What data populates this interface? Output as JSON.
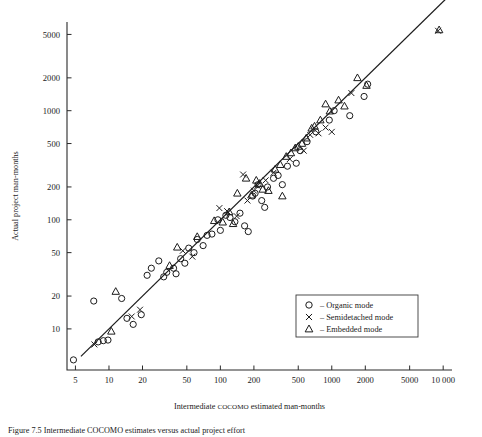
{
  "figure": {
    "caption": "Figure 7.5 Intermediate COCOMO estimates versus actual project effort"
  },
  "chart_data": {
    "type": "scatter",
    "title": "",
    "xlabel_prefix": "Intermediate ",
    "xlabel_smallcaps": "COCOMO",
    "xlabel_suffix": " estimated man-months",
    "xlabel": "Intermediate COCOMO estimated man-months",
    "ylabel": "Actual project man-months",
    "xscale": "log",
    "yscale": "log",
    "xlim": [
      4.2,
      12000
    ],
    "ylim": [
      4.2,
      6500
    ],
    "grid": false,
    "xticks": [
      5,
      10,
      20,
      50,
      100,
      200,
      500,
      1000,
      2000,
      5000,
      10000
    ],
    "xticklabels": [
      "5",
      "10",
      "20",
      "50",
      "100",
      "200",
      "500",
      "1000",
      "2000",
      "5000",
      "10 000"
    ],
    "yticks": [
      10,
      20,
      50,
      100,
      200,
      500,
      1000,
      2000,
      5000
    ],
    "yticklabels": [
      "10",
      "20",
      "50",
      "100",
      "200",
      "500",
      "1000",
      "2000",
      "5000"
    ],
    "reference_line": {
      "label": "y = x",
      "x_from": 5.6,
      "x_to": 10500,
      "y_from": 5.6,
      "y_to": 10500
    },
    "legend": {
      "position": "lower-right",
      "entries": [
        {
          "marker": "circle",
          "dash": "–",
          "label": "Organic mode"
        },
        {
          "marker": "cross",
          "dash": "–",
          "label": "Semidetached mode"
        },
        {
          "marker": "triangle",
          "dash": "–",
          "label": "Embedded mode"
        }
      ]
    },
    "series": [
      {
        "name": "Organic mode",
        "marker": "circle",
        "points": [
          [
            4.8,
            5.2
          ],
          [
            7.3,
            18.0
          ],
          [
            8.0,
            7.6
          ],
          [
            8.9,
            7.8
          ],
          [
            9.8,
            7.9
          ],
          [
            13.0,
            19.0
          ],
          [
            14.5,
            12.5
          ],
          [
            16.5,
            11.0
          ],
          [
            19.5,
            13.5
          ],
          [
            22.0,
            31.0
          ],
          [
            24.0,
            36.0
          ],
          [
            28.0,
            42.0
          ],
          [
            31.0,
            30.0
          ],
          [
            33.0,
            33.0
          ],
          [
            38.0,
            36.0
          ],
          [
            40.0,
            32.0
          ],
          [
            44.0,
            44.0
          ],
          [
            48.0,
            40.0
          ],
          [
            52.0,
            55.0
          ],
          [
            58.0,
            50.0
          ],
          [
            62.0,
            66.0
          ],
          [
            70.0,
            58.0
          ],
          [
            76.0,
            72.0
          ],
          [
            84.0,
            74.0
          ],
          [
            95.0,
            100.0
          ],
          [
            100.0,
            80.0
          ],
          [
            112.0,
            110.0
          ],
          [
            122.0,
            105.0
          ],
          [
            135.0,
            96.0
          ],
          [
            150.0,
            115.0
          ],
          [
            165.0,
            88.0
          ],
          [
            178.0,
            78.0
          ],
          [
            195.0,
            165.0
          ],
          [
            205.0,
            175.0
          ],
          [
            218.0,
            210.0
          ],
          [
            235.0,
            150.0
          ],
          [
            250.0,
            130.0
          ],
          [
            265.0,
            200.0
          ],
          [
            300.0,
            240.0
          ],
          [
            330.0,
            255.0
          ],
          [
            360.0,
            210.0
          ],
          [
            400.0,
            310.0
          ],
          [
            480.0,
            330.0
          ],
          [
            520.0,
            430.0
          ],
          [
            600.0,
            520.0
          ],
          [
            720.0,
            640.0
          ],
          [
            950.0,
            820.0
          ],
          [
            1050.0,
            1000.0
          ],
          [
            1450.0,
            900.0
          ],
          [
            1950.0,
            1350.0
          ],
          [
            2100.0,
            1750.0
          ]
        ]
      },
      {
        "name": "Semidetached mode",
        "marker": "cross",
        "points": [
          [
            7.4,
            7.2
          ],
          [
            16.0,
            13.0
          ],
          [
            19.0,
            15.0
          ],
          [
            46.0,
            52.0
          ],
          [
            56.0,
            46.0
          ],
          [
            98.0,
            128.0
          ],
          [
            115.0,
            120.0
          ],
          [
            140.0,
            108.0
          ],
          [
            160.0,
            260.0
          ],
          [
            175.0,
            150.0
          ],
          [
            200.0,
            185.0
          ],
          [
            215.0,
            205.0
          ],
          [
            255.0,
            230.0
          ],
          [
            300.0,
            270.0
          ],
          [
            420.0,
            360.0
          ],
          [
            560.0,
            430.0
          ],
          [
            640.0,
            600.0
          ],
          [
            760.0,
            620.0
          ],
          [
            880.0,
            700.0
          ],
          [
            1000.0,
            640.0
          ],
          [
            1500.0,
            1450.0
          ],
          [
            9000.0,
            5400.0
          ]
        ]
      },
      {
        "name": "Embedded mode",
        "marker": "triangle",
        "points": [
          [
            10.5,
            9.5
          ],
          [
            11.5,
            22.0
          ],
          [
            35.0,
            38.0
          ],
          [
            41.0,
            56.0
          ],
          [
            62.0,
            70.0
          ],
          [
            88.0,
            98.0
          ],
          [
            105.0,
            95.0
          ],
          [
            120.0,
            118.0
          ],
          [
            130.0,
            92.0
          ],
          [
            142.0,
            175.0
          ],
          [
            170.0,
            240.0
          ],
          [
            190.0,
            168.0
          ],
          [
            210.0,
            230.0
          ],
          [
            225.0,
            215.0
          ],
          [
            240.0,
            190.0
          ],
          [
            270.0,
            185.0
          ],
          [
            310.0,
            290.0
          ],
          [
            345.0,
            320.0
          ],
          [
            360.0,
            165.0
          ],
          [
            390.0,
            380.0
          ],
          [
            430.0,
            410.0
          ],
          [
            470.0,
            455.0
          ],
          [
            500.0,
            470.0
          ],
          [
            540.0,
            500.0
          ],
          [
            590.0,
            560.0
          ],
          [
            660.0,
            690.0
          ],
          [
            700.0,
            720.0
          ],
          [
            790.0,
            820.0
          ],
          [
            880.0,
            1150.0
          ],
          [
            960.0,
            990.0
          ],
          [
            1150.0,
            1250.0
          ],
          [
            1300.0,
            1100.0
          ],
          [
            1700.0,
            2000.0
          ],
          [
            2050.0,
            1700.0
          ],
          [
            9200.0,
            5500.0
          ]
        ]
      }
    ]
  }
}
